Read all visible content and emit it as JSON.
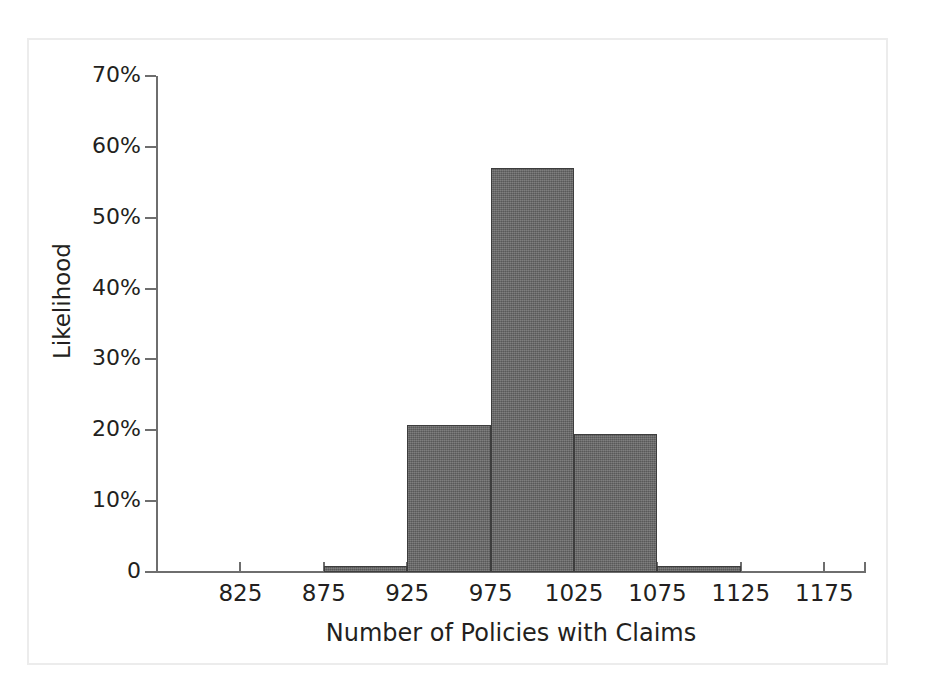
{
  "chart_data": {
    "type": "bar",
    "title": "",
    "subtitle": "",
    "xlabel": "Number of Policies with Claims",
    "ylabel": "Likelihood",
    "categories": [
      "800",
      "850",
      "900",
      "950",
      "1000",
      "1050",
      "1100",
      "1150"
    ],
    "bin_centers": [
      800,
      850,
      900,
      950,
      1000,
      1050,
      1100,
      1150
    ],
    "bin_edges": [
      775,
      825,
      875,
      925,
      975,
      1025,
      1075,
      1125,
      1175
    ],
    "values": [
      0,
      0,
      0.8,
      20.8,
      57.0,
      19.5,
      0.8,
      0
    ],
    "value_unit": "%",
    "xlim": [
      775,
      1200
    ],
    "ylim": [
      0,
      70
    ],
    "x_ticks": [
      825,
      875,
      925,
      975,
      1025,
      1075,
      1125,
      1175
    ],
    "x_tick_labels": [
      "825",
      "875",
      "925",
      "975",
      "1025",
      "1075",
      "1125",
      "1175"
    ],
    "y_ticks": [
      0,
      10,
      20,
      30,
      40,
      50,
      60,
      70
    ],
    "y_tick_labels": [
      "0",
      "10%",
      "20%",
      "30%",
      "40%",
      "50%",
      "60%",
      "70%"
    ],
    "grid": false,
    "legend": false,
    "legend_position": "none",
    "bar_color": "#646464",
    "bar_edge_color": "#3d3d3d",
    "axis_color": "#6e6e6e",
    "text_color": "#231f20",
    "frame_color": "#ececec",
    "background_color": "#ffffff"
  }
}
